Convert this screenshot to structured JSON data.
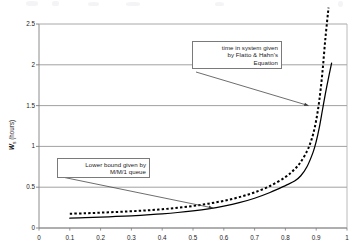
{
  "chart_data": {
    "type": "line",
    "title": "",
    "xlabel": "",
    "ylabel": "Ws (hours)",
    "ylabel_base": "W",
    "ylabel_sub": "s",
    "ylabel_unit": " (hours)",
    "xlim": [
      0,
      1
    ],
    "ylim": [
      0,
      2.5
    ],
    "xticks": [
      "0",
      "0.1",
      "0.2",
      "0.3",
      "0.4",
      "0.5",
      "0.6",
      "0.7",
      "0.8",
      "0.9",
      "1"
    ],
    "xtick_values": [
      0,
      0.1,
      0.2,
      0.3,
      0.4,
      0.5,
      0.6,
      0.7,
      0.8,
      0.9,
      1
    ],
    "yticks": [
      "0",
      "0.5",
      "1",
      "1.5",
      "2",
      "2.5"
    ],
    "ytick_values": [
      0,
      0.5,
      1,
      1.5,
      2,
      2.5
    ],
    "grid": "horizontal",
    "legend": "none",
    "series": [
      {
        "name": "time in system given by Flatto & Hahn's Equation",
        "style": "dotted",
        "color": "#000000",
        "x": [
          0.1,
          0.15,
          0.2,
          0.25,
          0.3,
          0.35,
          0.4,
          0.45,
          0.5,
          0.55,
          0.6,
          0.65,
          0.7,
          0.75,
          0.8,
          0.83,
          0.85,
          0.87,
          0.88,
          0.89,
          0.9,
          0.91,
          0.92,
          0.93,
          0.94
        ],
        "y": [
          0.175,
          0.18,
          0.188,
          0.196,
          0.205,
          0.216,
          0.23,
          0.248,
          0.27,
          0.298,
          0.333,
          0.378,
          0.437,
          0.515,
          0.625,
          0.72,
          0.81,
          0.94,
          1.03,
          1.15,
          1.32,
          1.56,
          1.9,
          2.33,
          2.7
        ]
      },
      {
        "name": "Lower bound given by M/M/1 queue",
        "style": "solid",
        "color": "#000000",
        "x": [
          0.1,
          0.15,
          0.2,
          0.25,
          0.3,
          0.35,
          0.4,
          0.45,
          0.5,
          0.55,
          0.6,
          0.65,
          0.7,
          0.75,
          0.8,
          0.83,
          0.85,
          0.87,
          0.89,
          0.9,
          0.91,
          0.92,
          0.93,
          0.94,
          0.95
        ],
        "y": [
          0.12,
          0.126,
          0.133,
          0.141,
          0.15,
          0.161,
          0.174,
          0.19,
          0.21,
          0.235,
          0.268,
          0.31,
          0.365,
          0.435,
          0.52,
          0.575,
          0.64,
          0.75,
          0.93,
          1.06,
          1.23,
          1.44,
          1.65,
          1.84,
          2.02
        ]
      }
    ],
    "annotations": [
      {
        "id": "flatto",
        "lines": [
          "time in system given",
          "by Flatto & Hahn's",
          "Equation"
        ],
        "target_x": 0.875,
        "target_y": 1.5
      },
      {
        "id": "lower",
        "lines": [
          "Lower bound given by",
          "M/M/1 queue"
        ],
        "target_x": 0.565,
        "target_y": 0.245
      }
    ]
  }
}
